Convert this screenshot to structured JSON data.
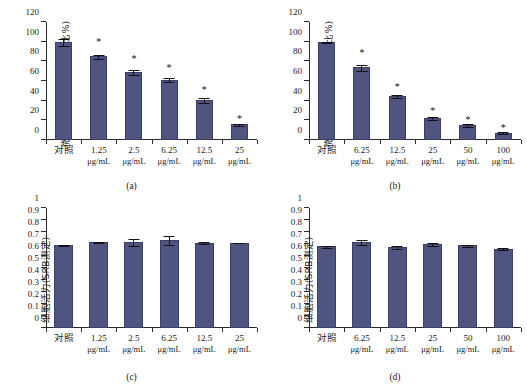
{
  "figure": {
    "bar_color": "#4f5480",
    "bar_edge_color": "#3a3f68",
    "axis_color": "#2a2a2a",
    "significance_marker": "*"
  },
  "panels": [
    {
      "id": "a",
      "caption": "(a)",
      "ylabel": "微球体形成(与对照组相比%)",
      "chart_data": {
        "type": "bar",
        "title": "",
        "xlabel": "",
        "ylabel": "微球体形成(与对照组相比%)",
        "ylim": [
          0,
          120
        ],
        "yticks": [
          0,
          20,
          40,
          60,
          80,
          100,
          120
        ],
        "ytick_labels": [
          "0",
          "20",
          "40",
          "60",
          "80",
          "100",
          "120"
        ],
        "grid": false,
        "legend": "none",
        "categories": [
          "对照",
          "1.25 μg/mL",
          "2.5 μg/mL",
          "6.25 μg/mL",
          "12.5 μg/mL",
          "25 μg/mL"
        ],
        "category_lines": [
          {
            "conc": "对照",
            "unit": ""
          },
          {
            "conc": "1.25",
            "unit": "μg/mL"
          },
          {
            "conc": "2.5",
            "unit": "μg/mL"
          },
          {
            "conc": "6.25",
            "unit": "μg/mL"
          },
          {
            "conc": "12.5",
            "unit": "μg/mL"
          },
          {
            "conc": "25",
            "unit": "μg/mL"
          }
        ],
        "values": [
          100,
          85,
          69,
          61.5,
          41,
          16
        ],
        "errors": [
          4,
          2.5,
          3,
          2.5,
          3,
          2
        ],
        "significance": [
          false,
          true,
          true,
          true,
          true,
          true
        ]
      }
    },
    {
      "id": "b",
      "caption": "(b)",
      "ylabel": "微球体形成(与对照组相比%)",
      "chart_data": {
        "type": "bar",
        "title": "",
        "xlabel": "",
        "ylabel": "微球体形成(与对照组相比%)",
        "ylim": [
          0,
          120
        ],
        "yticks": [
          0,
          20,
          40,
          60,
          80,
          100,
          120
        ],
        "ytick_labels": [
          "0",
          "20",
          "40",
          "60",
          "80",
          "100",
          "120"
        ],
        "grid": false,
        "legend": "none",
        "categories": [
          "对照",
          "6.25 μg/mL",
          "12.5 μg/mL",
          "25 μg/mL",
          "50 μg/mL",
          "100 μg/mL"
        ],
        "category_lines": [
          {
            "conc": "对照",
            "unit": ""
          },
          {
            "conc": "6.25",
            "unit": "μg/mL"
          },
          {
            "conc": "12.5",
            "unit": "μg/mL"
          },
          {
            "conc": "25",
            "unit": "μg/mL"
          },
          {
            "conc": "50",
            "unit": "μg/mL"
          },
          {
            "conc": "100",
            "unit": "μg/mL"
          }
        ],
        "values": [
          100,
          74,
          45,
          22.5,
          15,
          7.5
        ],
        "errors": [
          1,
          3.5,
          2,
          2.5,
          2.5,
          2.5
        ],
        "significance": [
          false,
          true,
          true,
          true,
          true,
          true
        ]
      }
    },
    {
      "id": "c",
      "caption": "(c)",
      "ylabel": "细胞活力(SRB测定)",
      "chart_data": {
        "type": "bar",
        "title": "",
        "xlabel": "",
        "ylabel": "细胞活力(SRB测定)",
        "ylim": [
          0,
          1
        ],
        "yticks": [
          0,
          0.1,
          0.2,
          0.3,
          0.4,
          0.5,
          0.6,
          0.7,
          0.8,
          0.9,
          1
        ],
        "ytick_labels": [
          "0",
          "0.1",
          "0.2",
          "0.3",
          "0.4",
          "0.5",
          "0.6",
          "0.7",
          "0.8",
          "0.9",
          "1"
        ],
        "grid": false,
        "legend": "none",
        "categories": [
          "对照",
          "1.25 μg/mL",
          "2.5 μg/mL",
          "6.25 μg/mL",
          "12.5 μg/mL",
          "25 μg/mL"
        ],
        "category_lines": [
          {
            "conc": "对照",
            "unit": ""
          },
          {
            "conc": "1.25",
            "unit": "μg/mL"
          },
          {
            "conc": "2.5",
            "unit": "μg/mL"
          },
          {
            "conc": "6.25",
            "unit": "μg/mL"
          },
          {
            "conc": "12.5",
            "unit": "μg/mL"
          },
          {
            "conc": "25",
            "unit": "μg/mL"
          }
        ],
        "values": [
          0.69,
          0.715,
          0.715,
          0.735,
          0.71,
          0.71
        ],
        "errors": [
          0.008,
          0.008,
          0.035,
          0.045,
          0.012,
          0.005
        ],
        "significance": [
          false,
          false,
          false,
          false,
          false,
          false
        ]
      }
    },
    {
      "id": "d",
      "caption": "(d)",
      "ylabel": "细胞活力(SRB测定)",
      "chart_data": {
        "type": "bar",
        "title": "",
        "xlabel": "",
        "ylabel": "细胞活力(SRB测定)",
        "ylim": [
          0,
          1
        ],
        "yticks": [
          0,
          0.1,
          0.2,
          0.3,
          0.4,
          0.5,
          0.6,
          0.7,
          0.8,
          0.9,
          1
        ],
        "ytick_labels": [
          "0",
          "0.1",
          "0.2",
          "0.3",
          "0.4",
          "0.5",
          "0.6",
          "0.7",
          "0.8",
          "0.9",
          "1"
        ],
        "grid": false,
        "legend": "none",
        "categories": [
          "对照",
          "6.25 μg/mL",
          "12.5 μg/mL",
          "25 μg/mL",
          "50 μg/mL",
          "100 μg/mL"
        ],
        "category_lines": [
          {
            "conc": "对照",
            "unit": ""
          },
          {
            "conc": "6.25",
            "unit": "μg/mL"
          },
          {
            "conc": "12.5",
            "unit": "μg/mL"
          },
          {
            "conc": "25",
            "unit": "μg/mL"
          },
          {
            "conc": "50",
            "unit": "μg/mL"
          },
          {
            "conc": "100",
            "unit": "μg/mL"
          }
        ],
        "values": [
          0.68,
          0.715,
          0.675,
          0.7,
          0.69,
          0.66
        ],
        "errors": [
          0.012,
          0.025,
          0.018,
          0.02,
          0.012,
          0.013
        ],
        "significance": [
          false,
          false,
          false,
          false,
          false,
          false
        ]
      }
    }
  ]
}
